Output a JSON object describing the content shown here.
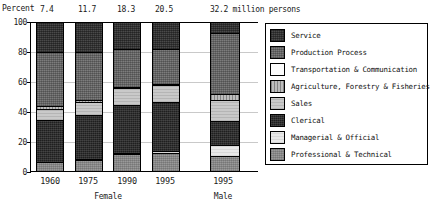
{
  "chart_data": {
    "type": "bar",
    "subtype": "100% stacked column",
    "title": "",
    "ylabel": "Percent",
    "xlabel": "",
    "ylim": [
      0,
      100
    ],
    "yticks": [
      "0",
      "20",
      "40",
      "60",
      "80",
      "100"
    ],
    "grid": true,
    "legend_position": "right",
    "unit_note": "32.2 million persons",
    "categories": [
      "1960",
      "1975",
      "1990",
      "1995",
      "1995"
    ],
    "group_labels": [
      "Female",
      "Male"
    ],
    "totals": [
      "7.4",
      "11.7",
      "18.3",
      "20.5",
      "32.2"
    ],
    "series": [
      {
        "name": "Professional & Technical",
        "values": [
          7,
          8,
          12,
          13,
          11
        ]
      },
      {
        "name": "Managerial & Official",
        "values": [
          0,
          1,
          1,
          1,
          7
        ]
      },
      {
        "name": "Clerical",
        "values": [
          28,
          29,
          32,
          33,
          16
        ]
      },
      {
        "name": "Sales",
        "values": [
          7,
          9,
          11,
          11,
          14
        ]
      },
      {
        "name": "Agriculture, Forestry & Fisheries",
        "values": [
          2,
          1,
          1,
          1,
          4
        ]
      },
      {
        "name": "Transportation & Communication",
        "values": [
          0,
          0,
          0,
          0,
          0
        ]
      },
      {
        "name": "Production Process",
        "values": [
          36,
          32,
          25,
          23,
          41
        ]
      },
      {
        "name": "Service",
        "values": [
          20,
          20,
          18,
          18,
          7
        ]
      }
    ]
  },
  "axis": {
    "percent_label": "Percent",
    "unit_note": "32.2 million persons",
    "yticks": [
      "100",
      "80",
      "60",
      "40",
      "20",
      "0"
    ],
    "xticks": [
      "1960",
      "1975",
      "1990",
      "1995",
      "1995"
    ],
    "groups": [
      "Female",
      "Male"
    ]
  },
  "totals": {
    "t1960": "7.4",
    "t1975": "11.7",
    "t1990": "18.3",
    "t1995f": "20.5",
    "t1995m": "32.2 million persons"
  },
  "legend": {
    "items": [
      {
        "label": "Service",
        "key": "service",
        "color": "#4a4a4a"
      },
      {
        "label": "Production Process",
        "key": "production",
        "color": "#7d7d7d"
      },
      {
        "label": "Transportation & Communication",
        "key": "transport",
        "color": "#fcfcfc"
      },
      {
        "label": "Agriculture, Forestry & Fisheries",
        "key": "agri",
        "color": "#bdbdbd"
      },
      {
        "label": "Sales",
        "key": "sales",
        "color": "#c9c9c9"
      },
      {
        "label": "Clerical",
        "key": "clerical",
        "color": "#1f1f1f"
      },
      {
        "label": "Managerial & Official",
        "key": "managerial",
        "color": "#e8e8e8"
      },
      {
        "label": "Professional & Technical",
        "key": "professional",
        "color": "#9a9a9a"
      }
    ]
  }
}
